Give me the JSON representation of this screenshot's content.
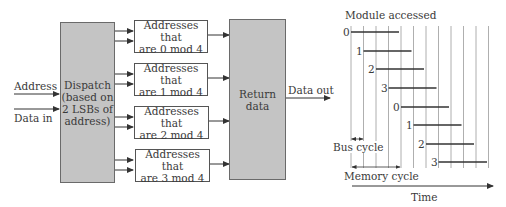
{
  "block_diagram": {
    "inputs": [
      {
        "label": "Address"
      },
      {
        "label": "Data in"
      }
    ],
    "dispatch": {
      "lines": [
        "Dispatch",
        "(based on",
        "2 LSBs of",
        "address)"
      ]
    },
    "modules": [
      {
        "line1": "Addresses that",
        "line2": "are 0 mod 4"
      },
      {
        "line1": "Addresses that",
        "line2": "are 1 mod 4"
      },
      {
        "line1": "Addresses that",
        "line2": "are 2 mod 4"
      },
      {
        "line1": "Addresses that",
        "line2": "are 3 mod 4"
      }
    ],
    "return_data": {
      "lines": [
        "Return",
        "data"
      ]
    },
    "output": {
      "label": "Data out"
    }
  },
  "timing_diagram": {
    "title": "Module accessed",
    "accesses": [
      {
        "module": "0"
      },
      {
        "module": "1"
      },
      {
        "module": "2"
      },
      {
        "module": "3"
      },
      {
        "module": "0"
      },
      {
        "module": "1"
      },
      {
        "module": "2"
      },
      {
        "module": "3"
      }
    ],
    "bus_cycle_label": "Bus cycle",
    "memory_cycle_label": "Memory cycle",
    "time_label": "Time",
    "bus_cycles_per_memory_cycle": 4,
    "vertical_grid_lines": 12
  },
  "colors": {
    "block_fill": "#c4c4c4",
    "line": "#3a3a3a",
    "grid": "#9a9a9a"
  }
}
